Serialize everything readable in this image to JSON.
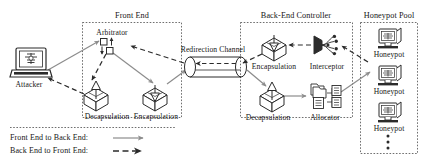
{
  "figure": {
    "type": "architecture-diagram",
    "title_visible": false
  },
  "groups": {
    "front_end": {
      "label": "Front End"
    },
    "back_end_controller": {
      "label": "Back-End Controller"
    },
    "honeypot_pool": {
      "label": "Honeypot Pool"
    }
  },
  "nodes": {
    "attacker": {
      "label": "Attacker",
      "icon": "laptop-icon"
    },
    "arbitrator": {
      "label": "Arbitrator",
      "icon": "arbitrator-icon"
    },
    "fe_decapsulation": {
      "label": "Decapsulation",
      "icon": "open-box-icon"
    },
    "fe_encapsulation": {
      "label": "Encapsulation",
      "icon": "open-box-icon"
    },
    "redirection_channel": {
      "label": "Redirection Channel",
      "icon": "tube-icon"
    },
    "be_encapsulation": {
      "label": "Encapsulation",
      "icon": "open-box-icon"
    },
    "interceptor": {
      "label": "Interceptor",
      "icon": "funnel-icon"
    },
    "be_decapsulation": {
      "label": "Decapsulation",
      "icon": "open-box-icon"
    },
    "allocator": {
      "label": "Allocator",
      "icon": "allocator-icon"
    },
    "honeypot_1": {
      "label": "Honeypot",
      "icon": "monitor-icon"
    },
    "honeypot_2": {
      "label": "Honeypot",
      "icon": "monitor-icon"
    },
    "honeypot_3": {
      "label": "Honeypot",
      "icon": "monitor-icon"
    },
    "honeypot_more": {
      "label": "⋮",
      "icon": "vertical-ellipsis-icon"
    }
  },
  "legend": {
    "items": [
      {
        "label": "Front End to Back End:",
        "style": "solid-arrow"
      },
      {
        "label": "Back End to Front End:",
        "style": "dashed-arrow"
      }
    ]
  },
  "colors": {
    "stroke": "#2b2b2b",
    "solid_flow": "#8c8c8c",
    "dashed_flow": "#2b2b2b",
    "group_border": "#4a4a4a",
    "text": "#151515",
    "background": "#ffffff"
  }
}
